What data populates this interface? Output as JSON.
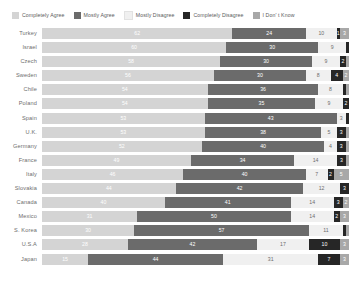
{
  "chart_data": {
    "type": "bar",
    "subtype": "stacked-horizontal-100pct",
    "title": "",
    "xlabel": "",
    "ylabel": "",
    "xlim": [
      0,
      100
    ],
    "grid": false,
    "legend_position": "top-left",
    "categories": [
      "Turkey",
      "Israel",
      "Czech",
      "Sweden",
      "Chile",
      "Poland",
      "Spain",
      "U.K.",
      "Germany",
      "France",
      "Italy",
      "Slovakia",
      "Canada",
      "Mexico",
      "S. Korea",
      "U.S.A",
      "Japan"
    ],
    "series": [
      {
        "name": "Completely Agree",
        "color": "#d4d4d4",
        "values": [
          62,
          60,
          58,
          56,
          54,
          54,
          53,
          53,
          52,
          49,
          46,
          44,
          40,
          31,
          30,
          28,
          15
        ]
      },
      {
        "name": "Mostly Agree",
        "color": "#6b6b6b",
        "values": [
          24,
          30,
          30,
          30,
          36,
          35,
          43,
          38,
          40,
          34,
          40,
          42,
          41,
          50,
          57,
          42,
          44
        ]
      },
      {
        "name": "Mostly Disagree",
        "color": "#f0f0f0",
        "values": [
          10,
          9,
          9,
          8,
          8,
          9,
          3,
          5,
          4,
          14,
          7,
          12,
          14,
          14,
          11,
          17,
          31
        ]
      },
      {
        "name": "Completely Disagree",
        "color": "#262626",
        "values": [
          1,
          1,
          2,
          4,
          1,
          2,
          1,
          3,
          3,
          3,
          2,
          3,
          3,
          2,
          1,
          10,
          7
        ]
      },
      {
        "name": "I Don' t Know",
        "color": "#a8a8a8",
        "values": [
          3,
          0,
          1,
          2,
          1,
          0,
          0,
          1,
          1,
          1,
          5,
          0,
          2,
          3,
          1,
          3,
          3
        ]
      }
    ],
    "labels_shown": {
      "Turkey": [
        "62",
        "24",
        "10",
        "1",
        "3"
      ],
      "Israel": [
        "60",
        "30",
        "9",
        "",
        ""
      ],
      "Czech": [
        "58",
        "30",
        "9",
        "2",
        ""
      ],
      "Sweden": [
        "56",
        "30",
        "8",
        "4",
        "2"
      ],
      "Chile": [
        "54",
        "36",
        "8",
        "",
        ""
      ],
      "Poland": [
        "54",
        "35",
        "9",
        "2",
        ""
      ],
      "Spain": [
        "53",
        "43",
        "3",
        "",
        ""
      ],
      "U.K.": [
        "53",
        "38",
        "5",
        "3",
        ""
      ],
      "Germany": [
        "52",
        "40",
        "4",
        "3",
        ""
      ],
      "France": [
        "49",
        "34",
        "14",
        "3",
        ""
      ],
      "Italy": [
        "46",
        "40",
        "7",
        "2",
        "5"
      ],
      "Slovakia": [
        "44",
        "42",
        "12",
        "3",
        ""
      ],
      "Canada": [
        "40",
        "41",
        "14",
        "3",
        "2"
      ],
      "Mexico": [
        "31",
        "50",
        "14",
        "2",
        "3"
      ],
      "S. Korea": [
        "30",
        "57",
        "11",
        "",
        ""
      ],
      "U.S.A": [
        "28",
        "42",
        "17",
        "10",
        "3"
      ],
      "Japan": [
        "15",
        "44",
        "31",
        "7",
        "3"
      ]
    }
  },
  "legend": {
    "items": [
      {
        "label": "Completely Agree",
        "color": "#d4d4d4"
      },
      {
        "label": "Mostly Agree",
        "color": "#6b6b6b"
      },
      {
        "label": "Mostly Disagree",
        "color": "#f0f0f0"
      },
      {
        "label": "Completely Disagree",
        "color": "#262626"
      },
      {
        "label": "I Don' t Know",
        "color": "#a8a8a8"
      }
    ]
  },
  "colors": {
    "background": "#ffffff",
    "label_text": "#6d6d6d",
    "legend_text": "#5a5a5a",
    "value_text_on_light": "#ffffff",
    "value_text_on_dark": "#ffffff",
    "value_text_on_pale": "#6d6d6d"
  }
}
